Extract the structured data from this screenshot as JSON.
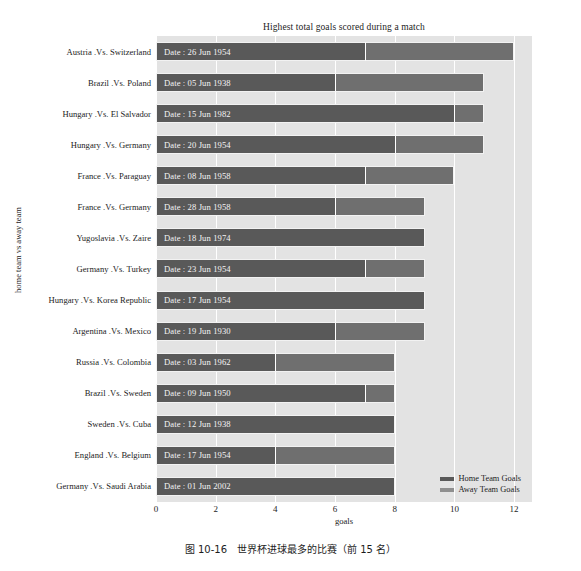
{
  "chart_data": {
    "type": "bar",
    "orientation": "horizontal",
    "stacked": true,
    "title": "Highest total goals scored during a match",
    "xlabel": "goals",
    "ylabel": "home team vs away team",
    "xlim": [
      0,
      12.6
    ],
    "xticks": [
      0,
      2,
      4,
      6,
      8,
      10,
      12
    ],
    "xticklabels": [
      "0",
      "2",
      "4",
      "6",
      "8",
      "10",
      "12"
    ],
    "grid": "vertical-white",
    "legend": {
      "position": "lower right",
      "entries": [
        {
          "label": "Home Team Goals",
          "color": "#595959"
        },
        {
          "label": "Away Team Goals",
          "color": "#8f8f8f"
        }
      ]
    },
    "categories": [
      "Austria .Vs. Switzerland",
      "Brazil .Vs. Poland",
      "Hungary .Vs. El Salvador",
      "Hungary .Vs. Germany",
      "France .Vs. Paraguay",
      "France .Vs. Germany",
      "Yugoslavia .Vs. Zaire",
      "Germany .Vs. Turkey",
      "Hungary .Vs. Korea Republic",
      "Argentina .Vs. Mexico",
      "Russia .Vs. Colombia",
      "Brazil .Vs. Sweden",
      "Sweden .Vs. Cuba",
      "England .Vs. Belgium",
      "Germany .Vs. Saudi Arabia"
    ],
    "series": [
      {
        "name": "Home Team Goals",
        "color": "#595959",
        "values": [
          7,
          6,
          10,
          8,
          7,
          6,
          9,
          7,
          9,
          6,
          4,
          7,
          8,
          4,
          8
        ]
      },
      {
        "name": "Away Team Goals",
        "color": "#6f6f6f",
        "values": [
          5,
          5,
          1,
          3,
          3,
          3,
          0,
          2,
          0,
          3,
          4,
          1,
          0,
          4,
          0
        ]
      }
    ],
    "bar_annotations": [
      "Date : 26 Jun 1954",
      "Date : 05 Jun 1938",
      "Date : 15 Jun 1982",
      "Date : 20 Jun 1954",
      "Date : 08 Jun 1958",
      "Date : 28 Jun 1958",
      "Date : 18 Jun 1974",
      "Date : 23 Jun 1954",
      "Date : 17 Jun 1954",
      "Date : 19 Jun 1930",
      "Date : 03 Jun 1962",
      "Date : 09 Jun 1950",
      "Date : 12 Jun 1938",
      "Date : 17 Jun 1954",
      "Date : 01 Jun 2002"
    ],
    "totals": [
      12,
      11,
      11,
      11,
      10,
      9,
      9,
      9,
      9,
      9,
      8,
      8,
      8,
      8,
      8
    ]
  },
  "caption": "图 10-16　世界杯进球最多的比赛（前 15 名）",
  "colors": {
    "plot_background": "#e3e3e3",
    "gridline": "#ffffff",
    "home_bar": "#595959",
    "away_bar": "#6f6f6f",
    "text": "#1d1d1d",
    "bar_label_text": "#f4f4f4"
  }
}
